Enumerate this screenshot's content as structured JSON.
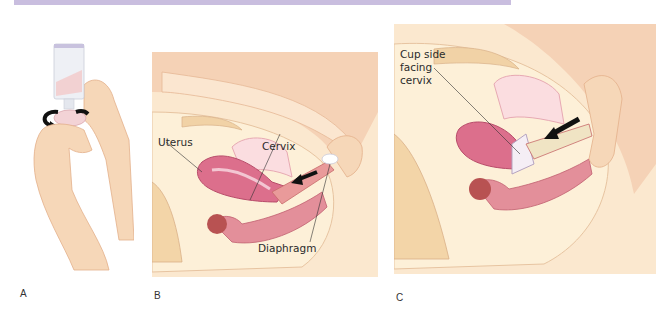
{
  "figure": {
    "header_bar_color": "#c9bedf",
    "panels": [
      {
        "id": "A",
        "label": "A",
        "description": "Applying spermicide into diaphragm cup"
      },
      {
        "id": "B",
        "label": "B",
        "description": "Inserting diaphragm",
        "callouts": [
          "Uterus",
          "Cervix",
          "Diaphragm"
        ]
      },
      {
        "id": "C",
        "label": "C",
        "description": "Diaphragm in place",
        "callouts": [
          "Cup side",
          "facing",
          "cervix"
        ]
      }
    ]
  }
}
